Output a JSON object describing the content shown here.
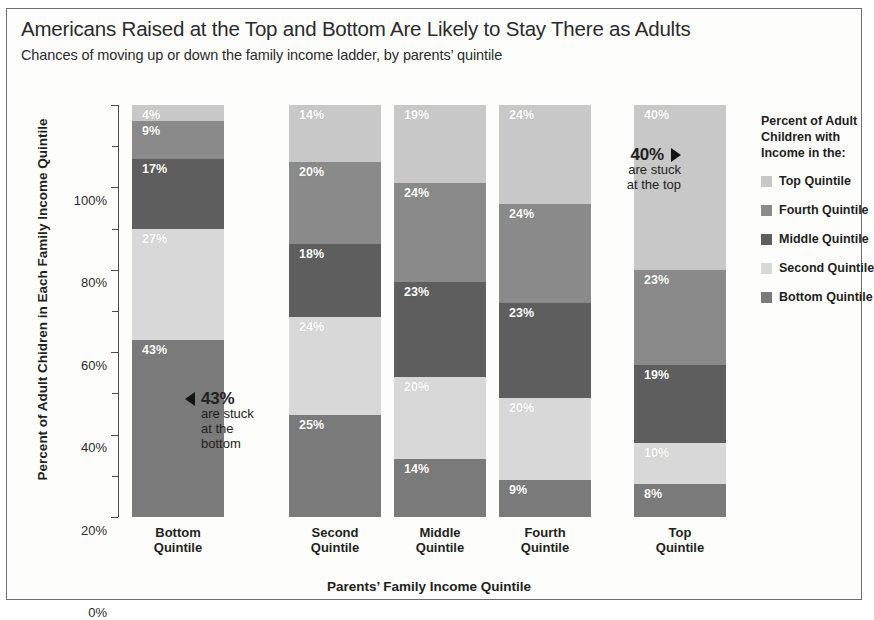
{
  "header": {
    "title": "Americans Raised at the Top and Bottom Are Likely to Stay There as Adults",
    "subtitle": "Chances of moving up or down the family income ladder, by parents’ quintile"
  },
  "legend": {
    "title": "Percent of Adult Children with Income in the:",
    "title_line1": "Percent of Adult",
    "title_line2": "Children with",
    "title_line3": "Income in the:",
    "items": [
      {
        "label": "Top Quintile",
        "color": "#c8c8c8"
      },
      {
        "label": "Fourth Quintile",
        "color": "#8a8a8a"
      },
      {
        "label": "Middle Quintile",
        "color": "#5e5e5e"
      },
      {
        "label": "Second Quintile",
        "color": "#d8d8d8"
      },
      {
        "label": "Bottom Quintile",
        "color": "#7a7a7a"
      }
    ]
  },
  "annotations": [
    {
      "name": "stuck-at-bottom",
      "value": "43%",
      "line1": "are stuck",
      "line2": "at the",
      "line3": "bottom",
      "arrow": "left"
    },
    {
      "name": "stuck-at-top",
      "value": "40%",
      "line1": "are stuck",
      "line2": "at the top",
      "line3": "",
      "arrow": "right"
    }
  ],
  "chart_data": {
    "type": "bar",
    "stacked": true,
    "title": "Americans Raised at the Top and Bottom Are Likely to Stay There as Adults",
    "subtitle": "Chances of moving up or down the family income ladder, by parents’ quintile",
    "xlabel": "Parents’ Family Income Quintile",
    "ylabel": "Percent of Adult Chidren in Each Family Income Quintile",
    "ylim": [
      0,
      100
    ],
    "yticks": [
      "0%",
      "20%",
      "40%",
      "60%",
      "80%",
      "100%"
    ],
    "ytick_values": [
      0,
      20,
      40,
      60,
      80,
      100
    ],
    "grid": false,
    "legend_position": "right",
    "categories": [
      "Bottom Quintile",
      "Second Quintile",
      "Middle Quintile",
      "Fourth Quintile",
      "Top Quintile"
    ],
    "category_lines": [
      [
        "Bottom",
        "Quintile"
      ],
      [
        "Second",
        "Quintile"
      ],
      [
        "Middle",
        "Quintile"
      ],
      [
        "Fourth",
        "Quintile"
      ],
      [
        "Top",
        "Quintile"
      ]
    ],
    "series": [
      {
        "name": "Bottom Quintile",
        "color": "#7a7a7a",
        "values": [
          43,
          25,
          14,
          9,
          8
        ]
      },
      {
        "name": "Second Quintile",
        "color": "#d8d8d8",
        "values": [
          27,
          24,
          20,
          20,
          10
        ]
      },
      {
        "name": "Middle Quintile",
        "color": "#5e5e5e",
        "values": [
          17,
          18,
          23,
          23,
          19
        ]
      },
      {
        "name": "Fourth Quintile",
        "color": "#8a8a8a",
        "values": [
          9,
          20,
          24,
          24,
          23
        ]
      },
      {
        "name": "Top Quintile",
        "color": "#c8c8c8",
        "values": [
          4,
          14,
          19,
          24,
          40
        ]
      }
    ],
    "bar_labels": [
      [
        "43%",
        "27%",
        "17%",
        "9%",
        "4%"
      ],
      [
        "25%",
        "24%",
        "18%",
        "20%",
        "14%"
      ],
      [
        "14%",
        "20%",
        "23%",
        "24%",
        "19%"
      ],
      [
        "9%",
        "20%",
        "23%",
        "24%",
        "24%"
      ],
      [
        "8%",
        "10%",
        "19%",
        "23%",
        "40%"
      ]
    ]
  }
}
